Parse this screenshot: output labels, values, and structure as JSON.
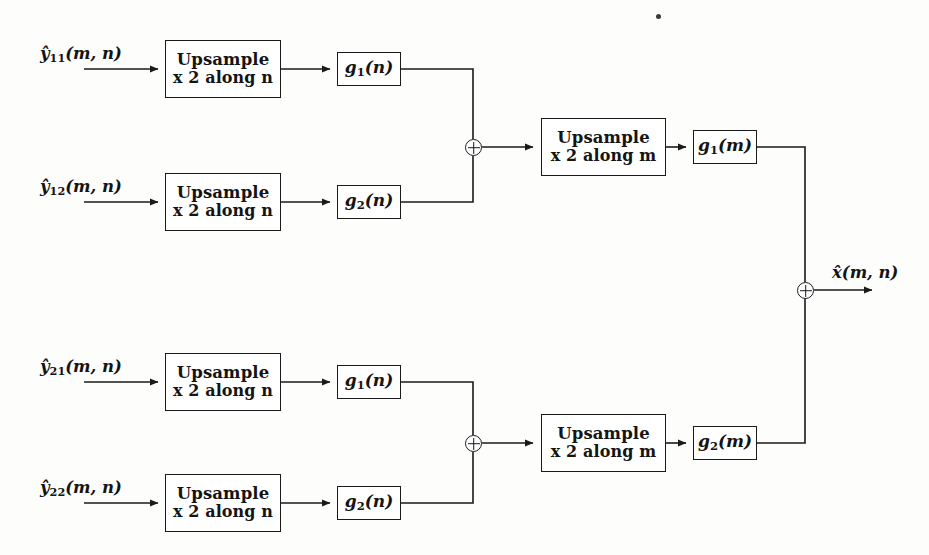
{
  "diagram": {
    "stroke_color": "#1a1a1a",
    "background_color": "#fdfdfc",
    "inputs": [
      {
        "id": "y11",
        "label": "ŷ11(m, n)",
        "base": "y",
        "subscript": "11",
        "args": "(m, n)",
        "row": 1
      },
      {
        "id": "y12",
        "label": "ŷ12(m, n)",
        "base": "y",
        "subscript": "12",
        "args": "(m, n)",
        "row": 2
      },
      {
        "id": "y21",
        "label": "ŷ21(m, n)",
        "base": "y",
        "subscript": "21",
        "args": "(m, n)",
        "row": 3
      },
      {
        "id": "y22",
        "label": "ŷ22(m, n)",
        "base": "y",
        "subscript": "22",
        "args": "(m, n)",
        "row": 4
      }
    ],
    "output": {
      "id": "xhat",
      "label": "x̂(m, n)",
      "base": "x",
      "args": "(m, n)"
    },
    "upsample_n_blocks": [
      {
        "id": "up-n-1",
        "line1": "Upsample",
        "line2": "x 2 along n",
        "row": 1
      },
      {
        "id": "up-n-2",
        "line1": "Upsample",
        "line2": "x 2 along n",
        "row": 2
      },
      {
        "id": "up-n-3",
        "line1": "Upsample",
        "line2": "x 2 along n",
        "row": 3
      },
      {
        "id": "up-n-4",
        "line1": "Upsample",
        "line2": "x 2 along n",
        "row": 4
      }
    ],
    "upsample_m_blocks": [
      {
        "id": "up-m-top",
        "line1": "Upsample",
        "line2": "x 2 along m",
        "branch": "top"
      },
      {
        "id": "up-m-bottom",
        "line1": "Upsample",
        "line2": "x 2 along m",
        "branch": "bottom"
      }
    ],
    "filters_n": [
      {
        "id": "g1n-top",
        "base": "g",
        "subscript": "1",
        "args": "(n)",
        "label": "g1(n)",
        "row": 1
      },
      {
        "id": "g2n-top",
        "base": "g",
        "subscript": "2",
        "args": "(n)",
        "label": "g2(n)",
        "row": 2
      },
      {
        "id": "g1n-bot",
        "base": "g",
        "subscript": "1",
        "args": "(n)",
        "label": "g1(n)",
        "row": 3
      },
      {
        "id": "g2n-bot",
        "base": "g",
        "subscript": "2",
        "args": "(n)",
        "label": "g2(n)",
        "row": 4
      }
    ],
    "filters_m": [
      {
        "id": "g1m",
        "base": "g",
        "subscript": "1",
        "args": "(m)",
        "label": "g1(m)",
        "branch": "top"
      },
      {
        "id": "g2m",
        "base": "g",
        "subscript": "2",
        "args": "(m)",
        "label": "g2(m)",
        "branch": "bottom"
      }
    ],
    "adders": [
      {
        "id": "adder-top",
        "symbol": "⊕",
        "branch": "top"
      },
      {
        "id": "adder-bottom",
        "symbol": "⊕",
        "branch": "bottom"
      },
      {
        "id": "adder-output",
        "symbol": "⊕",
        "branch": "output"
      }
    ],
    "words": {
      "upsample": "Upsample",
      "factor_along_n": "x 2 along n",
      "factor_along_m": "x 2 along m"
    }
  }
}
